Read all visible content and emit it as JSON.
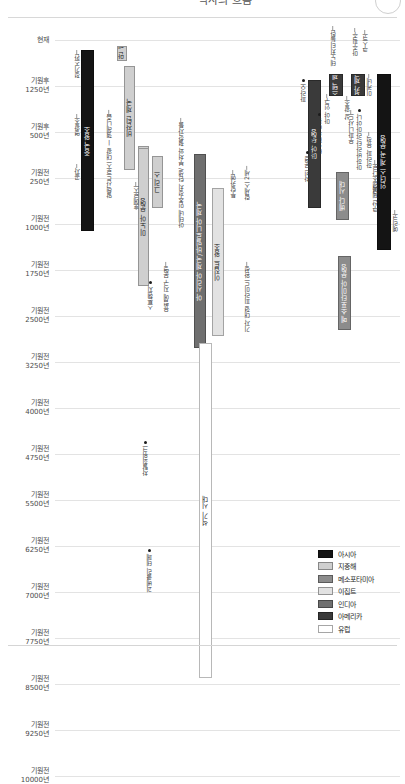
{
  "header": {
    "title": "역사의 흐름",
    "circle_icon": "circle-badge-icon"
  },
  "axis": {
    "ticks": [
      {
        "line1": "현재",
        "line2": "",
        "y": 22
      },
      {
        "line1": "기원후",
        "line2": "1250년",
        "y": 68
      },
      {
        "line1": "기원후",
        "line2": "500년",
        "y": 114
      },
      {
        "line1": "기원전",
        "line2": "250년",
        "y": 160
      },
      {
        "line1": "기원전",
        "line2": "1000년",
        "y": 206
      },
      {
        "line1": "기원전",
        "line2": "1750년",
        "y": 252
      },
      {
        "line1": "기원전",
        "line2": "2500년",
        "y": 298
      },
      {
        "line1": "기원전",
        "line2": "3250년",
        "y": 344
      },
      {
        "line1": "기원전",
        "line2": "4000년",
        "y": 390
      },
      {
        "line1": "기원전",
        "line2": "4750년",
        "y": 436
      },
      {
        "line1": "기원전",
        "line2": "5500년",
        "y": 482
      },
      {
        "line1": "기원전",
        "line2": "6250년",
        "y": 528
      },
      {
        "line1": "기원전",
        "line2": "7000년",
        "y": 574
      },
      {
        "line1": "기원전",
        "line2": "7750년",
        "y": 620
      },
      {
        "line1": "기원전",
        "line2": "8500년",
        "y": 666
      },
      {
        "line1": "기원전",
        "line2": "9250년",
        "y": 712
      },
      {
        "line1": "기원전",
        "line2": "10000년",
        "y": 758
      }
    ]
  },
  "colors": {
    "asia": "#141414",
    "mediterranean": "#cfcfcf",
    "mesopotamia": "#8c8c8c",
    "egypt": "#e2e2e2",
    "india": "#6f6f6f",
    "america": "#3a3a3a",
    "europe": "#ffffff"
  },
  "legend": {
    "items": [
      {
        "label": "아시아",
        "color": "#141414"
      },
      {
        "label": "지중해",
        "color": "#cfcfcf"
      },
      {
        "label": "메소포타미아",
        "color": "#8c8c8c"
      },
      {
        "label": "이집트",
        "color": "#e2e2e2"
      },
      {
        "label": "인디아",
        "color": "#6f6f6f"
      },
      {
        "label": "아메리카",
        "color": "#3a3a3a"
      },
      {
        "label": "유럽",
        "color": "#ffffff"
      }
    ]
  },
  "chart_data": {
    "type": "bar",
    "title": "역사의 흐름",
    "xlabel": "",
    "ylabel": "연대",
    "orientation": "vertical-timeline",
    "grid": true,
    "legend_position": "bottom-right",
    "ylim": [
      "현재",
      "기원전 10000년"
    ],
    "categories": [
      "아시아",
      "지중해",
      "메소포타미아",
      "이집트",
      "인디아",
      "아메리카",
      "유럽"
    ],
    "bars": [
      {
        "label": "중국 왕조",
        "region": "아시아",
        "color": "#141414",
        "text_color": "#ffffff",
        "x": 81,
        "w": 13,
        "y_top": 32,
        "y_bottom": 213
      },
      {
        "label": "비잔틴 제국",
        "region": "지중해",
        "color": "#cfcfcf",
        "text_color": "#1a1a1a",
        "x": 124,
        "w": 11,
        "y_top": 48,
        "y_bottom": 152
      },
      {
        "label": "오스만 제국",
        "region": "지중해",
        "color": "#cfcfcf",
        "text_color": "#1a1a1a",
        "x": 117,
        "w": 10,
        "y_top": 28,
        "y_bottom": 43
      },
      {
        "label": "로마",
        "region": "지중해",
        "color": "#cfcfcf",
        "text_color": "#1a1a1a",
        "x": 138,
        "w": 11,
        "y_top": 128,
        "y_bottom": 180
      },
      {
        "label": "그리스",
        "region": "지중해",
        "color": "#cfcfcf",
        "text_color": "#1a1a1a",
        "x": 152,
        "w": 11,
        "y_top": 138,
        "y_bottom": 190
      },
      {
        "label": "미노아 문명",
        "region": "지중해",
        "color": "#cfcfcf",
        "text_color": "#1a1a1a",
        "x": 138,
        "w": 11,
        "y_top": 130,
        "y_bottom": 268
      },
      {
        "label": "아시리아 제국/바빌로니아 제국",
        "region": "인디아",
        "color": "#6f6f6f",
        "text_color": "#ffffff",
        "x": 194,
        "w": 12,
        "y_top": 136,
        "y_bottom": 330
      },
      {
        "label": "이집트 왕조",
        "region": "이집트",
        "color": "#e2e2e2",
        "text_color": "#1a1a1a",
        "x": 212,
        "w": 12,
        "y_top": 170,
        "y_bottom": 318
      },
      {
        "label": "석기 시대",
        "region": "유럽",
        "color": "#ffffff",
        "text_color": "#1a1a1a",
        "x": 199,
        "w": 13,
        "y_top": 325,
        "y_bottom": 660
      },
      {
        "label": "마야 문명",
        "region": "아메리카",
        "color": "#3a3a3a",
        "text_color": "#ffffff",
        "x": 308,
        "w": 13,
        "y_top": 62,
        "y_bottom": 190
      },
      {
        "label": "아즈텍 제국",
        "region": "아메리카",
        "color": "#3a3a3a",
        "text_color": "#ffffff",
        "x": 329,
        "w": 14,
        "y_top": 56,
        "y_bottom": 78
      },
      {
        "label": "잉카 제국",
        "region": "아메리카",
        "color": "#3a3a3a",
        "text_color": "#ffffff",
        "x": 351,
        "w": 14,
        "y_top": 56,
        "y_bottom": 78
      },
      {
        "label": "베다 시대",
        "region": "메소포타미아",
        "color": "#8c8c8c",
        "text_color": "#ffffff",
        "x": 336,
        "w": 13,
        "y_top": 154,
        "y_bottom": 202
      },
      {
        "label": "메소포타미아 문명",
        "region": "메소포타미아",
        "color": "#8c8c8c",
        "text_color": "#ffffff",
        "x": 338,
        "w": 13,
        "y_top": 238,
        "y_bottom": 312
      },
      {
        "label": "인더스 계곡 문명",
        "region": "아시아",
        "color": "#141414",
        "text_color": "#ffffff",
        "x": 377,
        "w": 14,
        "y_top": 56,
        "y_bottom": 232
      }
    ],
    "annotations": [
      {
        "label": "청기즈칸",
        "x": 74,
        "y_top": 36,
        "type": "tick"
      },
      {
        "label": "명왕조",
        "x": 74,
        "y_top": 100,
        "type": "tick"
      },
      {
        "label": "공자",
        "x": 74,
        "y_top": 150,
        "type": "tick"
      },
      {
        "label": "알렉산드로스 대왕 ㅣ 헬레니즘",
        "x": 106,
        "y_top": 96,
        "type": "tick"
      },
      {
        "label": "호메로스",
        "x": 133,
        "y_top": 168,
        "type": "tick"
      },
      {
        "label": "스톤헨지",
        "x": 147,
        "y_top": 268,
        "type": "dot"
      },
      {
        "label": "유럽에 지구 문명",
        "x": 163,
        "y_top": 248,
        "type": "tick"
      },
      {
        "label": "아테네 민주정치 탄생/ 부처와 철학자들",
        "x": 178,
        "y_top": 104,
        "type": "tick"
      },
      {
        "label": "기자 대형 피라미드 완성",
        "x": 244,
        "y_top": 248,
        "type": "tick"
      },
      {
        "label": "람세스 2세",
        "x": 244,
        "y_top": 152,
        "type": "tick"
      },
      {
        "label": "투탕카멘",
        "x": 230,
        "y_top": 156,
        "type": "tick"
      },
      {
        "label": "파라오",
        "x": 300,
        "y_top": 66,
        "type": "dot"
      },
      {
        "label": "테노치티틀란",
        "x": 330,
        "y_top": 12,
        "type": "tick"
      },
      {
        "label": "마추픽추",
        "x": 352,
        "y_top": 14,
        "type": "tick"
      },
      {
        "label": "쿠스코",
        "x": 362,
        "y_top": 16,
        "type": "tick"
      },
      {
        "label": "마야 인구",
        "x": 324,
        "y_top": 80,
        "type": "tick"
      },
      {
        "label": "테오티우아칸",
        "x": 316,
        "y_top": 100,
        "type": "dot"
      },
      {
        "label": "올메카 문명",
        "x": 309,
        "y_top": 118,
        "type": "tick"
      },
      {
        "label": "차빈 문명",
        "x": 304,
        "y_top": 138,
        "type": "dot"
      },
      {
        "label": "상 왕조",
        "x": 344,
        "y_top": 82,
        "type": "tick"
      },
      {
        "label": "우파니샤드",
        "x": 348,
        "y_top": 96,
        "type": "tick"
      },
      {
        "label": "마하바라타/라마야나",
        "x": 356,
        "y_top": 96,
        "type": "dot"
      },
      {
        "label": "미케네",
        "x": 366,
        "y_top": 60,
        "type": "tick"
      },
      {
        "label": "하라파 유적",
        "x": 366,
        "y_top": 118,
        "type": "tick"
      },
      {
        "label": "모헨조다로",
        "x": 372,
        "y_top": 146,
        "type": "tick"
      },
      {
        "label": "쿠샨 제국",
        "x": 372,
        "y_top": 168,
        "type": "tick"
      },
      {
        "label": "예리코",
        "x": 392,
        "y_top": 196,
        "type": "tick"
      },
      {
        "label": "차탈회위크",
        "x": 142,
        "y_top": 428,
        "type": "dot"
      },
      {
        "label": "괴베클리 테페",
        "x": 146,
        "y_top": 536,
        "type": "dot"
      }
    ]
  }
}
